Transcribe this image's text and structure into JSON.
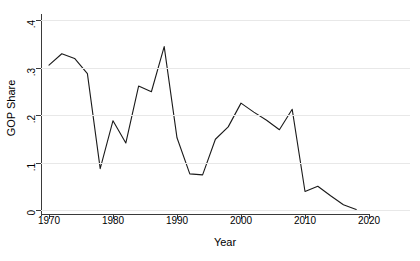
{
  "chart_data": {
    "type": "line",
    "title": "",
    "xlabel": "Year",
    "ylabel": "GOP Share",
    "xlim": [
      1968,
      2021
    ],
    "ylim": [
      0,
      0.4
    ],
    "xticks": [
      1970,
      1980,
      1990,
      2000,
      2010,
      2020
    ],
    "xtick_labels": [
      "1970",
      "1980",
      "1990",
      "2000",
      "2010",
      "2020"
    ],
    "yticks": [
      0,
      0.1,
      0.2,
      0.3,
      0.4
    ],
    "ytick_labels": [
      "0",
      ".1",
      ".2",
      ".3",
      ".4"
    ],
    "grid": "horizontal",
    "legend": "none",
    "line_color": "#1a1a1a",
    "grid_color": "#e8e8e8",
    "axis_color": "#3a3a3a",
    "background": "#ffffff",
    "series": [
      {
        "name": "GOP Share",
        "x": [
          1970,
          1972,
          1974,
          1976,
          1978,
          1980,
          1982,
          1984,
          1986,
          1988,
          1990,
          1992,
          1994,
          1996,
          1998,
          2000,
          2002,
          2004,
          2006,
          2008,
          2010,
          2012,
          2014,
          2016,
          2018
        ],
        "values": [
          0.305,
          0.329,
          0.319,
          0.287,
          0.087,
          0.188,
          0.141,
          0.261,
          0.249,
          0.344,
          0.152,
          0.076,
          0.074,
          0.149,
          0.175,
          0.225,
          0.206,
          0.189,
          0.169,
          0.212,
          0.039,
          0.05,
          0.03,
          0.011,
          0.001
        ]
      }
    ]
  }
}
